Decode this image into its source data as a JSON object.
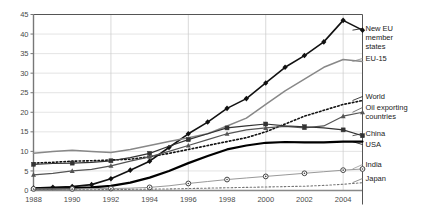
{
  "chart_data": {
    "type": "line",
    "title": "",
    "xlabel": "",
    "ylabel": "",
    "xlim": [
      1988,
      2005
    ],
    "ylim": [
      0,
      45
    ],
    "grid": true,
    "legend_position": "right",
    "x": [
      1988,
      1989,
      1990,
      1991,
      1992,
      1993,
      1994,
      1995,
      1996,
      1997,
      1998,
      1999,
      2000,
      2001,
      2002,
      2003,
      2004,
      2005
    ],
    "yticks": [
      0,
      5,
      10,
      15,
      20,
      25,
      30,
      35,
      40,
      45
    ],
    "xticks": [
      1988,
      1990,
      1992,
      1994,
      1996,
      1998,
      2000,
      2002,
      2004
    ],
    "xtick_labels": [
      "1988",
      "1990",
      "1992",
      "1994",
      "1996",
      "1998",
      "2000",
      "2002",
      "2004"
    ],
    "ytick_labels": [
      "0",
      "5",
      "10",
      "15",
      "20",
      "25",
      "30",
      "35",
      "40",
      "45"
    ],
    "series": [
      {
        "name": "New EU member states",
        "style": "solid",
        "marker": "diamond",
        "color": "#111111",
        "width": 1.6,
        "values": [
          0.6,
          0.8,
          1.0,
          1.5,
          3.0,
          5.2,
          7.5,
          11.0,
          14.5,
          17.5,
          21.0,
          23.5,
          27.5,
          31.5,
          34.5,
          38.0,
          43.5,
          41.0
        ]
      },
      {
        "name": "EU-15",
        "style": "solid",
        "marker": "none",
        "color": "#888888",
        "width": 1.5,
        "values": [
          9.5,
          10.0,
          10.3,
          10.0,
          9.7,
          10.5,
          11.5,
          12.5,
          13.5,
          14.5,
          16.5,
          18.5,
          22.0,
          25.5,
          28.5,
          31.5,
          33.5,
          33.0
        ]
      },
      {
        "name": "World",
        "style": "dotted",
        "marker": "none",
        "color": "#111111",
        "width": 1.6,
        "values": [
          7.0,
          7.2,
          7.5,
          7.6,
          7.8,
          8.0,
          8.6,
          9.5,
          10.5,
          11.5,
          12.5,
          13.5,
          15.0,
          17.0,
          19.0,
          20.5,
          22.0,
          23.0
        ]
      },
      {
        "name": "Oil exporting countries",
        "style": "solid",
        "marker": "triangle",
        "color": "#555555",
        "width": 1.2,
        "values": [
          4.0,
          4.4,
          5.0,
          5.4,
          6.3,
          7.5,
          8.6,
          10.0,
          11.5,
          13.0,
          14.5,
          15.5,
          16.0,
          16.4,
          16.0,
          16.5,
          19.0,
          20.0
        ]
      },
      {
        "name": "China",
        "style": "solid",
        "marker": "square",
        "color": "#333333",
        "width": 1.2,
        "values": [
          6.7,
          6.9,
          7.0,
          7.2,
          7.6,
          8.4,
          9.5,
          11.3,
          13.0,
          14.5,
          16.0,
          16.5,
          17.0,
          16.5,
          16.3,
          16.0,
          15.5,
          14.0
        ]
      },
      {
        "name": "USA",
        "style": "solid",
        "marker": "none",
        "color": "#000000",
        "width": 2.2,
        "values": [
          0.5,
          0.5,
          0.6,
          0.8,
          1.2,
          2.0,
          3.3,
          5.0,
          7.0,
          8.8,
          10.5,
          11.5,
          12.2,
          12.4,
          12.3,
          12.3,
          12.5,
          12.5
        ]
      },
      {
        "name": "India",
        "style": "solid",
        "marker": "circle",
        "color": "#999999",
        "width": 1.0,
        "values": [
          0.4,
          0.4,
          0.4,
          0.5,
          0.5,
          0.6,
          0.8,
          1.2,
          1.8,
          2.3,
          2.8,
          3.2,
          3.6,
          4.0,
          4.4,
          4.8,
          5.2,
          5.5
        ]
      },
      {
        "name": "Japan",
        "style": "dotted",
        "marker": "none",
        "color": "#777777",
        "width": 1.1,
        "values": [
          0.2,
          0.2,
          0.2,
          0.2,
          0.25,
          0.3,
          0.35,
          0.4,
          0.5,
          0.6,
          0.7,
          0.8,
          0.9,
          1.0,
          1.1,
          1.3,
          1.6,
          2.0
        ]
      }
    ],
    "legend_entries": [
      {
        "label": "New EU member states",
        "lines": [
          "New EU",
          "member",
          "states"
        ],
        "y": 31
      },
      {
        "label": "EU-15",
        "lines": [
          "EU-15"
        ],
        "y": 61
      },
      {
        "label": "World",
        "lines": [
          "World"
        ],
        "y": 99
      },
      {
        "label": "Oil exporting countries",
        "lines": [
          "Oil exporting",
          "countries"
        ],
        "y": 110
      },
      {
        "label": "China",
        "lines": [
          "China"
        ],
        "y": 136
      },
      {
        "label": "USA",
        "lines": [
          "USA"
        ],
        "y": 147
      },
      {
        "label": "India",
        "lines": [
          "India"
        ],
        "y": 167
      },
      {
        "label": "Japan",
        "lines": [
          "Japan"
        ],
        "y": 181
      }
    ]
  }
}
